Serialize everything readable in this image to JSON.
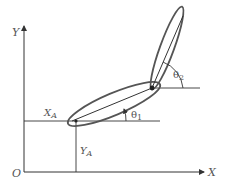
{
  "diagram": {
    "axes": {
      "x_label": "X",
      "y_label": "Y",
      "origin_label": "O"
    },
    "labels": {
      "xa_main": "X",
      "xa_sub": "A",
      "ya_main": "Y",
      "ya_sub": "A",
      "theta1_main": "θ",
      "theta1_sub": "1",
      "theta2_main": "θ",
      "theta2_sub": "2"
    },
    "colors": {
      "line": "#333333",
      "ellipse": "#555555",
      "text": "#555555"
    }
  }
}
